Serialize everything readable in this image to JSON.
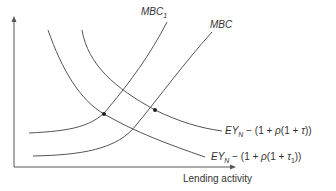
{
  "diagram": {
    "x_axis_label": "Lending activity",
    "curves": {
      "mbc1": {
        "label": "MBC",
        "subscript": "1"
      },
      "mbc": {
        "label": "MBC"
      },
      "demand_tau": {
        "prefix": "EY",
        "sub": "N",
        "middle": " − (1 + ",
        "rho": "ρ",
        "rest": "(1 + ",
        "tau": "τ",
        "tau_sub": "",
        "close": "))"
      },
      "demand_tau1": {
        "prefix": "EY",
        "sub": "N",
        "middle": " − (1 + ",
        "rho": "ρ",
        "rest": "(1 + ",
        "tau": "τ",
        "tau_sub": "1",
        "close": "))"
      }
    },
    "equilibrium_points": 2
  },
  "colors": {
    "line": "#555555",
    "text": "#333333",
    "point": "#222222"
  }
}
